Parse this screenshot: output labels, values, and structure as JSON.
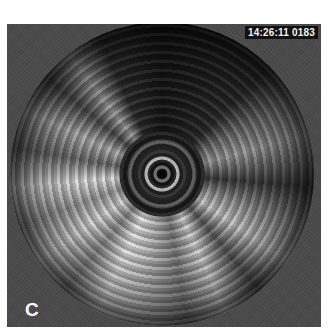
{
  "image": {
    "type": "intravascular ultrasound cross-section",
    "timestamp": "14:26:11",
    "frame_number": "0183",
    "overlay_text": "14:26:11 0183",
    "panel_label": "C"
  },
  "colors": {
    "background": "#ffffff",
    "frame": "#4a4a4a",
    "overlay_text": "#f2f2f2",
    "overlay_bg": "#111111",
    "catheter_core": "#000000"
  }
}
